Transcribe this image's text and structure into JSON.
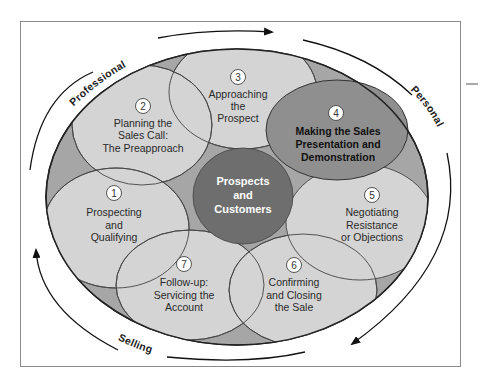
{
  "diagram": {
    "colors": {
      "background": "#ffffff",
      "frame": "#808080",
      "outer_ellipse": "#a6a6a6",
      "step_fill": "#d4d4d4",
      "highlight_step_fill": "#8f8f8f",
      "center_fill": "#6e6e6e",
      "stroke": "#333333"
    },
    "arc_labels": {
      "top_left": "Professional",
      "right": "Personal",
      "bottom_left": "Selling"
    },
    "center": {
      "lines": [
        "Prospects",
        "and",
        "Customers"
      ]
    },
    "steps": [
      {
        "number": "1",
        "lines": [
          "Prospecting",
          "and",
          "Qualifying"
        ],
        "highlighted": false
      },
      {
        "number": "2",
        "lines": [
          "Planning the",
          "Sales Call:",
          "The Preapproach"
        ],
        "highlighted": false
      },
      {
        "number": "3",
        "lines": [
          "Approaching",
          "the",
          "Prospect"
        ],
        "highlighted": false
      },
      {
        "number": "4",
        "lines": [
          "Making the Sales",
          "Presentation and",
          "Demonstration"
        ],
        "highlighted": true
      },
      {
        "number": "5",
        "lines": [
          "Negotiating",
          "Resistance",
          "or Objections"
        ],
        "highlighted": false
      },
      {
        "number": "6",
        "lines": [
          "Confirming",
          "and Closing",
          "the Sale"
        ],
        "highlighted": false
      },
      {
        "number": "7",
        "lines": [
          "Follow-up:",
          "Servicing the",
          "Account"
        ],
        "highlighted": false
      }
    ]
  }
}
